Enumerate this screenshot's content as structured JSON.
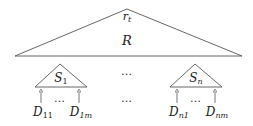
{
  "diagram": {
    "root": {
      "label": "r",
      "label_sub": "t",
      "name": "R"
    },
    "subtrees": [
      {
        "label": "S",
        "label_sub": "1",
        "leaves": [
          {
            "label": "D",
            "label_sub": "11"
          },
          {
            "label": "D",
            "label_sub": "1m"
          }
        ]
      },
      {
        "label": "S",
        "label_sub": "n",
        "leaves": [
          {
            "label": "D",
            "label_sub": "n1"
          },
          {
            "label": "D",
            "label_sub": "nm"
          }
        ]
      }
    ],
    "ellipsis": "…",
    "colors": {
      "stroke": "#555555",
      "text": "#222222",
      "background": "#ffffff"
    }
  }
}
